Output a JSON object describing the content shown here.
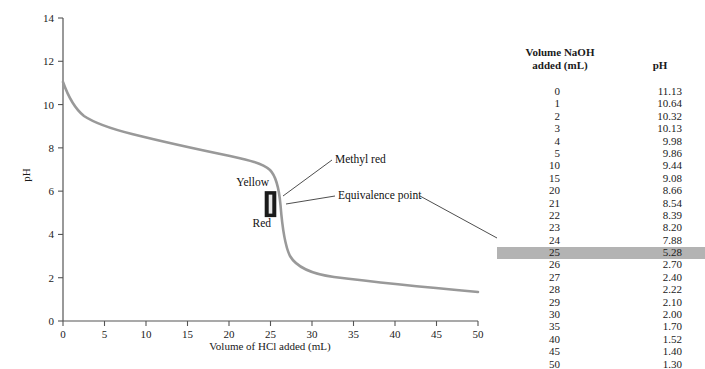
{
  "chart_data": {
    "type": "line",
    "title": "",
    "xlabel": "Volume of HCl added (mL)",
    "ylabel": "pH",
    "xlim": [
      0,
      50
    ],
    "ylim": [
      0,
      14
    ],
    "xticks": [
      0,
      5,
      10,
      15,
      20,
      25,
      30,
      35,
      40,
      45,
      50
    ],
    "yticks": [
      0,
      2,
      4,
      6,
      8,
      10,
      12,
      14
    ],
    "grid": false,
    "legend": "none",
    "curve_color": "#999999",
    "series": [
      {
        "name": "Titration of NaOH with HCl",
        "x": [
          0,
          1,
          2,
          3,
          4,
          5,
          10,
          15,
          20,
          21,
          22,
          23,
          24,
          25,
          26,
          27,
          28,
          29,
          30,
          35,
          40,
          45,
          50
        ],
        "y": [
          11.13,
          10.64,
          10.32,
          10.13,
          9.98,
          9.86,
          9.44,
          9.08,
          8.66,
          8.54,
          8.39,
          8.2,
          7.88,
          5.28,
          2.7,
          2.4,
          2.22,
          2.1,
          2.0,
          1.7,
          1.52,
          1.4,
          1.3
        ]
      }
    ],
    "annotations": [
      {
        "label": "Methyl red",
        "target_x": 25,
        "target_y": 5.9
      },
      {
        "label": "Equivalence point",
        "target_x": 25,
        "target_y": 5.28
      },
      {
        "label": "Yellow",
        "target_x": 23.5,
        "target_y": 6.3
      },
      {
        "label": "Red",
        "target_x": 23.5,
        "target_y": 4.6
      }
    ],
    "indicator_range": {
      "label": "methyl red",
      "ph_low": 4.8,
      "ph_high": 6.0,
      "color": "#1a1a1a"
    }
  },
  "annotations": {
    "methyl_red": "Methyl red",
    "equivalence_point": "Equivalence point",
    "yellow": "Yellow",
    "red": "Red"
  },
  "axes": {
    "ylabel": "pH",
    "xlabel": "Volume of HCl added (mL)",
    "xticks": [
      "0",
      "5",
      "10",
      "15",
      "20",
      "25",
      "30",
      "35",
      "40",
      "45",
      "50"
    ],
    "yticks": [
      "0",
      "2",
      "4",
      "6",
      "8",
      "10",
      "12",
      "14"
    ]
  },
  "table": {
    "header": {
      "volume_line1": "Volume NaOH",
      "volume_line2": "added (mL)",
      "ph": "pH"
    },
    "highlight_color": "#b3b3b3",
    "highlighted_row_index": 13,
    "rows": [
      {
        "volume": "0",
        "ph": "11.13"
      },
      {
        "volume": "1",
        "ph": "10.64"
      },
      {
        "volume": "2",
        "ph": "10.32"
      },
      {
        "volume": "3",
        "ph": "10.13"
      },
      {
        "volume": "4",
        "ph": "9.98"
      },
      {
        "volume": "5",
        "ph": "9.86"
      },
      {
        "volume": "10",
        "ph": "9.44"
      },
      {
        "volume": "15",
        "ph": "9.08"
      },
      {
        "volume": "20",
        "ph": "8.66"
      },
      {
        "volume": "21",
        "ph": "8.54"
      },
      {
        "volume": "22",
        "ph": "8.39"
      },
      {
        "volume": "23",
        "ph": "8.20"
      },
      {
        "volume": "24",
        "ph": "7.88"
      },
      {
        "volume": "25",
        "ph": "5.28"
      },
      {
        "volume": "26",
        "ph": "2.70"
      },
      {
        "volume": "27",
        "ph": "2.40"
      },
      {
        "volume": "28",
        "ph": "2.22"
      },
      {
        "volume": "29",
        "ph": "2.10"
      },
      {
        "volume": "30",
        "ph": "2.00"
      },
      {
        "volume": "35",
        "ph": "1.70"
      },
      {
        "volume": "40",
        "ph": "1.52"
      },
      {
        "volume": "45",
        "ph": "1.40"
      },
      {
        "volume": "50",
        "ph": "1.30"
      }
    ]
  }
}
